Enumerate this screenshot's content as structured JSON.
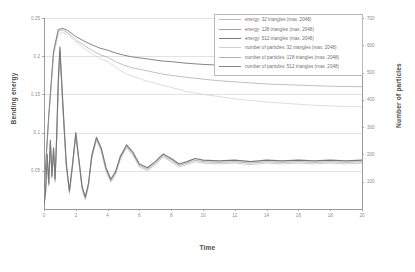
{
  "chart_data": {
    "type": "line",
    "title": "",
    "xlabel": "Time",
    "ylabel": "Bending energy",
    "ylabel_right": "Number of particles",
    "xlim": [
      0,
      20
    ],
    "ylim": [
      0,
      0.25
    ],
    "ylim_right": [
      0,
      700
    ],
    "grid": true,
    "legend_position": "top-right",
    "xticks": [
      "0",
      "2",
      "4",
      "6",
      "8",
      "10",
      "12",
      "14",
      "16",
      "18",
      "20"
    ],
    "xtick_values": [
      0,
      2,
      4,
      6,
      8,
      10,
      12,
      14,
      16,
      18,
      20
    ],
    "yticks_left": [
      "0.25",
      "0.2",
      "0.15",
      "0.1",
      "0.05"
    ],
    "ytick_values_left": [
      0.25,
      0.2,
      0.15,
      0.1,
      0.05
    ],
    "yticks_right": [
      "700",
      "600",
      "500",
      "400",
      "300",
      "200",
      "100"
    ],
    "ytick_values_right": [
      700,
      600,
      500,
      400,
      300,
      200,
      100
    ],
    "series": [
      {
        "name": "energy: 32 triangles (max. 2048)",
        "axis": "left",
        "color": "#b9b9b9",
        "width": 0.7,
        "x": [
          0,
          0.1,
          0.2,
          0.3,
          0.4,
          0.5,
          0.6,
          0.7,
          0.8,
          0.9,
          1.0,
          1.2,
          1.4,
          1.6,
          1.8,
          2.0,
          2.2,
          2.4,
          2.6,
          2.8,
          3.0,
          3.3,
          3.6,
          3.9,
          4.2,
          4.5,
          4.8,
          5.2,
          5.6,
          6.0,
          6.5,
          7.0,
          7.5,
          8.0,
          8.5,
          9.0,
          9.5,
          10,
          11,
          12,
          13,
          14,
          15,
          16,
          17,
          18,
          19,
          20
        ],
        "y": [
          0.005,
          0.02,
          0.065,
          0.03,
          0.085,
          0.04,
          0.075,
          0.035,
          0.09,
          0.16,
          0.205,
          0.125,
          0.055,
          0.02,
          0.055,
          0.095,
          0.06,
          0.025,
          0.012,
          0.03,
          0.065,
          0.09,
          0.075,
          0.05,
          0.035,
          0.045,
          0.065,
          0.08,
          0.07,
          0.055,
          0.05,
          0.058,
          0.068,
          0.062,
          0.055,
          0.058,
          0.062,
          0.06,
          0.059,
          0.06,
          0.058,
          0.06,
          0.059,
          0.06,
          0.059,
          0.06,
          0.059,
          0.06
        ]
      },
      {
        "name": "energy: 128 triangles (max. 2048)",
        "axis": "left",
        "color": "#a0a0a0",
        "width": 0.8,
        "x": [
          0,
          0.1,
          0.2,
          0.3,
          0.4,
          0.5,
          0.6,
          0.7,
          0.8,
          0.9,
          1.0,
          1.2,
          1.4,
          1.6,
          1.8,
          2.0,
          2.2,
          2.4,
          2.6,
          2.8,
          3.0,
          3.3,
          3.6,
          3.9,
          4.2,
          4.5,
          4.8,
          5.2,
          5.6,
          6.0,
          6.5,
          7.0,
          7.5,
          8.0,
          8.5,
          9.0,
          9.5,
          10,
          11,
          12,
          13,
          14,
          15,
          16,
          17,
          18,
          19,
          20
        ],
        "y": [
          0.005,
          0.022,
          0.07,
          0.032,
          0.088,
          0.042,
          0.078,
          0.038,
          0.095,
          0.165,
          0.208,
          0.13,
          0.058,
          0.022,
          0.058,
          0.098,
          0.062,
          0.027,
          0.014,
          0.032,
          0.068,
          0.092,
          0.078,
          0.052,
          0.037,
          0.047,
          0.067,
          0.082,
          0.072,
          0.057,
          0.052,
          0.06,
          0.07,
          0.064,
          0.057,
          0.06,
          0.064,
          0.062,
          0.061,
          0.062,
          0.06,
          0.062,
          0.061,
          0.062,
          0.061,
          0.062,
          0.061,
          0.062
        ]
      },
      {
        "name": "energy: 512 triangles (max. 2048)",
        "axis": "left",
        "color": "#787878",
        "width": 1.1,
        "x": [
          0,
          0.1,
          0.2,
          0.3,
          0.4,
          0.5,
          0.6,
          0.7,
          0.8,
          0.9,
          1.0,
          1.2,
          1.4,
          1.6,
          1.8,
          2.0,
          2.2,
          2.4,
          2.6,
          2.8,
          3.0,
          3.3,
          3.6,
          3.9,
          4.2,
          4.5,
          4.8,
          5.2,
          5.6,
          6.0,
          6.5,
          7.0,
          7.5,
          8.0,
          8.5,
          9.0,
          9.5,
          10,
          11,
          12,
          13,
          14,
          15,
          16,
          17,
          18,
          19,
          20
        ],
        "y": [
          0.005,
          0.024,
          0.072,
          0.034,
          0.09,
          0.044,
          0.08,
          0.04,
          0.098,
          0.17,
          0.212,
          0.133,
          0.06,
          0.024,
          0.06,
          0.1,
          0.064,
          0.029,
          0.016,
          0.034,
          0.07,
          0.094,
          0.08,
          0.054,
          0.039,
          0.049,
          0.069,
          0.084,
          0.074,
          0.059,
          0.054,
          0.062,
          0.072,
          0.066,
          0.059,
          0.062,
          0.066,
          0.064,
          0.063,
          0.064,
          0.062,
          0.064,
          0.063,
          0.064,
          0.063,
          0.064,
          0.063,
          0.064
        ]
      },
      {
        "name": "number of particles: 32 triangles (max. 2048)",
        "axis": "right",
        "color": "#cfcfcf",
        "width": 0.7,
        "x": [
          0,
          0.3,
          0.6,
          0.9,
          1.2,
          1.5,
          2.0,
          2.5,
          3.0,
          3.5,
          4.0,
          4.5,
          5.0,
          5.5,
          6.0,
          6.5,
          7.0,
          7.5,
          8.0,
          9.0,
          10,
          11,
          12,
          13,
          14,
          15,
          16,
          17,
          18,
          19,
          20
        ],
        "y": [
          60,
          330,
          560,
          640,
          648,
          640,
          612,
          590,
          570,
          552,
          540,
          520,
          500,
          488,
          478,
          468,
          462,
          452,
          446,
          430,
          420,
          412,
          404,
          398,
          392,
          388,
          384,
          380,
          378,
          376,
          374
        ]
      },
      {
        "name": "number of particles: 128 triangles (max. 2048)",
        "axis": "right",
        "color": "#b0b0b0",
        "width": 0.8,
        "x": [
          0,
          0.3,
          0.6,
          0.9,
          1.2,
          1.5,
          2.0,
          2.5,
          3.0,
          3.5,
          4.0,
          4.5,
          5.0,
          5.5,
          6.0,
          6.5,
          7.0,
          7.5,
          8.0,
          9.0,
          10,
          11,
          12,
          13,
          14,
          15,
          16,
          17,
          18,
          19,
          20
        ],
        "y": [
          60,
          340,
          572,
          652,
          656,
          646,
          620,
          600,
          582,
          566,
          556,
          540,
          528,
          518,
          512,
          506,
          500,
          494,
          490,
          482,
          476,
          470,
          466,
          462,
          458,
          456,
          454,
          452,
          450,
          449,
          448
        ]
      },
      {
        "name": "number of particles: 512 triangles (max. 2048)",
        "axis": "right",
        "color": "#858585",
        "width": 1.0,
        "x": [
          0,
          0.3,
          0.6,
          0.9,
          1.2,
          1.5,
          2.0,
          2.5,
          3.0,
          3.5,
          4.0,
          4.5,
          5.0,
          5.5,
          6.0,
          6.5,
          7.0,
          7.5,
          8.0,
          9.0,
          10,
          11,
          12,
          13,
          14,
          15,
          16,
          17,
          18,
          19,
          20
        ],
        "y": [
          60,
          345,
          578,
          658,
          662,
          654,
          632,
          616,
          602,
          590,
          582,
          572,
          564,
          558,
          554,
          550,
          546,
          542,
          540,
          534,
          530,
          527,
          524,
          522,
          520,
          519,
          518,
          517,
          516,
          516,
          515
        ]
      }
    ]
  },
  "legend": {
    "items": [
      "energy: 32 triangles (max. 2048)",
      "energy: 128 triangles (max. 2048)",
      "energy: 512 triangles (max. 2048)",
      "number of particles: 32 triangles (max. 2048)",
      "number of particles: 128 triangles (max. 2048)",
      "number of particles: 512 triangles (max. 2048)"
    ]
  }
}
